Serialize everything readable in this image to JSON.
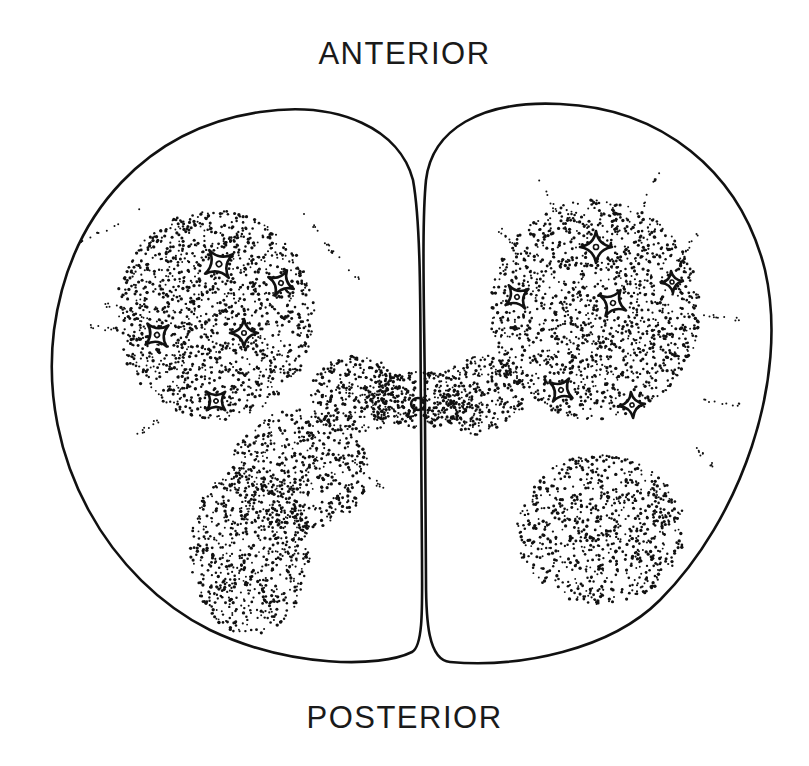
{
  "figure": {
    "type": "anatomical line drawing",
    "labels": {
      "top": "ANTERIOR",
      "bottom": "POSTERIOR"
    },
    "colors": {
      "ink": "#111111",
      "background": "#ffffff"
    },
    "left_half": {
      "neurons": [
        {
          "x": 219,
          "y": 264,
          "size": 17,
          "rot": 10
        },
        {
          "x": 281,
          "y": 283,
          "size": 14,
          "rot": -20
        },
        {
          "x": 157,
          "y": 335,
          "size": 15,
          "rot": 5
        },
        {
          "x": 244,
          "y": 333,
          "size": 14,
          "rot": 45
        },
        {
          "x": 216,
          "y": 401,
          "size": 13,
          "rot": 0
        }
      ]
    },
    "right_half": {
      "neurons": [
        {
          "x": 596,
          "y": 247,
          "size": 16,
          "rot": 45
        },
        {
          "x": 517,
          "y": 297,
          "size": 14,
          "rot": 10
        },
        {
          "x": 672,
          "y": 282,
          "size": 11,
          "rot": 40
        },
        {
          "x": 613,
          "y": 303,
          "size": 15,
          "rot": -15
        },
        {
          "x": 561,
          "y": 390,
          "size": 14,
          "rot": -10
        },
        {
          "x": 632,
          "y": 405,
          "size": 13,
          "rot": 40
        }
      ]
    },
    "central_canal": {
      "x": 418,
      "y": 404
    }
  }
}
